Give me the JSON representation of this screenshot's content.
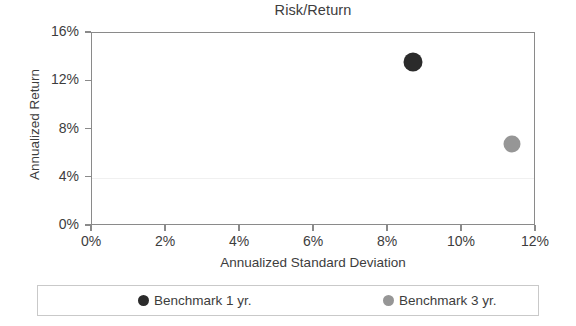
{
  "chart_data": {
    "type": "scatter",
    "title": "Risk/Return",
    "xlabel": "Annualized Standard Deviation",
    "ylabel": "Annualized Return",
    "xlim": [
      0,
      12
    ],
    "ylim": [
      0,
      16
    ],
    "xticks": [
      "0%",
      "2%",
      "4%",
      "6%",
      "8%",
      "10%",
      "12%"
    ],
    "xtick_values": [
      0,
      2,
      4,
      6,
      8,
      10,
      12
    ],
    "yticks": [
      "0%",
      "4%",
      "8%",
      "12%",
      "16%"
    ],
    "ytick_values": [
      0,
      4,
      8,
      12,
      16
    ],
    "grid": "faint horizontal gridline at 4%",
    "legend_position": "bottom",
    "series": [
      {
        "name": "Benchmark 1 yr.",
        "color": "#2b2b2b",
        "points": [
          {
            "x": 8.67,
            "y": 13.6
          }
        ]
      },
      {
        "name": "Benchmark 3 yr.",
        "color": "#969696",
        "points": [
          {
            "x": 11.35,
            "y": 6.8
          }
        ]
      }
    ]
  },
  "legend": {
    "entries": [
      {
        "label": "Benchmark 1 yr.",
        "color": "#2b2b2b"
      },
      {
        "label": "Benchmark 3 yr.",
        "color": "#969696"
      }
    ]
  },
  "style": {
    "axis_color": "#8a8a8a",
    "text_color": "#3d3d3d",
    "grid_color": "#f0f0f0",
    "legend_border": "#c9c9c9",
    "background": "#ffffff"
  }
}
